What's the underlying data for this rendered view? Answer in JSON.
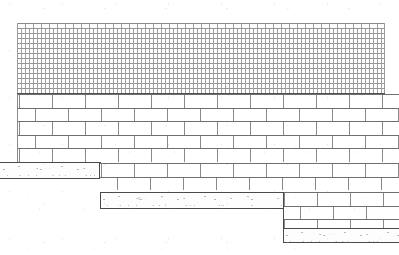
{
  "drawing": {
    "title": "Brick wall elevation with stepped footing",
    "medium": "scanned line drawing",
    "background_color": "#ffffff",
    "line_color": "#5d5d5d",
    "hatch_color": "#9a9a9a",
    "slab_edge_color": "#4a4a4a",
    "canvas": {
      "width": 399,
      "height": 255
    }
  },
  "regions": [
    {
      "id": "upper-hatched-masonry",
      "label": "Upper wall — fine brick hatch",
      "pattern": "fine-brick-hatch",
      "x": 17,
      "y": 23,
      "width": 368,
      "height": 70
    },
    {
      "id": "main-brick-wall",
      "label": "Main wall — running bond coursed brick",
      "pattern": "running-bond",
      "x": 17,
      "y": 93,
      "width": 382,
      "height": 70,
      "course_height": 13.5,
      "brick_length": 33
    },
    {
      "id": "mid-brick-wall",
      "label": "Middle wall below first step",
      "pattern": "running-bond",
      "x": 100,
      "y": 178,
      "width": 299,
      "height": 50,
      "course_height": 13.5,
      "brick_length": 33
    },
    {
      "id": "lower-brick-wall",
      "label": "Lower wall below second step",
      "pattern": "running-bond",
      "x": 283,
      "y": 192,
      "width": 116,
      "height": 36,
      "course_height": 13.5,
      "brick_length": 33
    }
  ],
  "footings": [
    {
      "id": "footing-upper-left",
      "label": "Upper left concrete footing course",
      "x": 0,
      "y": 162,
      "width": 100,
      "height": 17
    },
    {
      "id": "footing-middle",
      "label": "Middle concrete footing course",
      "x": 100,
      "y": 192,
      "width": 184,
      "height": 17
    },
    {
      "id": "footing-lower-right",
      "label": "Lower right concrete footing course",
      "x": 283,
      "y": 228,
      "width": 116,
      "height": 15
    }
  ],
  "steps": [
    {
      "id": "step-1",
      "label": "First footing step",
      "x": 100,
      "drop": 30
    },
    {
      "id": "step-2",
      "label": "Second footing step",
      "x": 283,
      "drop": 36
    }
  ],
  "annotations": [
    {
      "id": "faint-mark-1",
      "text": "·  ·",
      "x": 45,
      "y": 168
    },
    {
      "id": "faint-mark-2",
      "text": "2  ·  ·",
      "x": 138,
      "y": 197
    },
    {
      "id": "faint-mark-3",
      "text": "·   ·",
      "x": 330,
      "y": 233
    }
  ]
}
